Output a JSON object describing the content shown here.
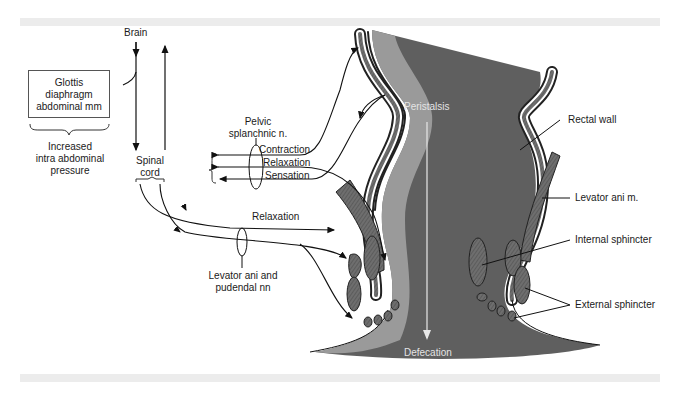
{
  "diagram": {
    "type": "anatomical-schematic",
    "colors": {
      "lumen_dark": "#5f5f5f",
      "lumen_light": "#9a9a9a",
      "muscle": "#6e6e6e",
      "line": "#111111",
      "frame_bar": "#ececec"
    },
    "labels": {
      "brain": "Brain",
      "spinal_cord_line1": "Spinal",
      "spinal_cord_line2": "cord",
      "box_line1": "Glottis",
      "box_line2": "diaphragm",
      "box_line3": "abdominal mm",
      "pressure_line1": "Increased",
      "pressure_line2": "intra abdominal",
      "pressure_line3": "pressure",
      "pelvic_line1": "Pelvic",
      "pelvic_line2": "splanchnic n.",
      "contraction": "Contraction",
      "relaxation_pelvic": "Relaxation",
      "sensation": "Sensation",
      "relaxation_pudendal": "Relaxation",
      "levator_nn_line1": "Levator ani and",
      "levator_nn_line2": "pudendal nn",
      "peristalsis": "Peristalsis",
      "defecation": "Defecation",
      "rectal_wall": "Rectal wall",
      "levator_ani_m": "Levator ani m.",
      "internal_sphincter": "Internal sphincter",
      "external_sphincter": "External sphincter"
    }
  }
}
